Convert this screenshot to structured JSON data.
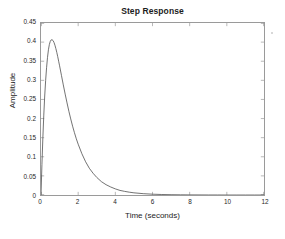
{
  "figure": {
    "background_color": "#ffffff",
    "axis_color": "#9a9a9a",
    "line_color": "#4d4d4d"
  },
  "chart_data": {
    "type": "line",
    "title": "Step Response",
    "xlabel": "Time (seconds)",
    "ylabel": "Amplitude",
    "xlim": [
      0,
      12
    ],
    "ylim": [
      0,
      0.45
    ],
    "grid": false,
    "legend": null,
    "xticks": [
      0,
      2,
      4,
      6,
      8,
      10,
      12
    ],
    "xtick_labels": [
      "0",
      "2",
      "4",
      "6",
      "8",
      "10",
      "12"
    ],
    "yticks": [
      0,
      0.05,
      0.1,
      0.15,
      0.2,
      0.25,
      0.3,
      0.35,
      0.4,
      0.45
    ],
    "ytick_labels": [
      "0",
      "0.05",
      "0.1",
      "0.15",
      "0.2",
      "0.25",
      "0.3",
      "0.35",
      "0.4",
      "0.45"
    ],
    "series": [
      {
        "name": "step response",
        "x": [
          0.0,
          0.05,
          0.1,
          0.15,
          0.2,
          0.25,
          0.3,
          0.35,
          0.4,
          0.45,
          0.5,
          0.55,
          0.6,
          0.65,
          0.7,
          0.75,
          0.8,
          0.85,
          0.9,
          0.95,
          1.0,
          1.1,
          1.2,
          1.3,
          1.4,
          1.5,
          1.6,
          1.7,
          1.8,
          1.9,
          2.0,
          2.2,
          2.4,
          2.6,
          2.8,
          3.0,
          3.25,
          3.5,
          3.75,
          4.0,
          4.25,
          4.5,
          4.75,
          5.0,
          5.5,
          6.0,
          6.5,
          7.0,
          7.5,
          8.0,
          8.5,
          9.0,
          9.5,
          10.0,
          10.5,
          11.0,
          11.5,
          12.0
        ],
        "y": [
          0.0,
          0.08,
          0.15,
          0.209,
          0.259,
          0.3,
          0.333,
          0.36,
          0.38,
          0.394,
          0.402,
          0.406,
          0.406,
          0.404,
          0.399,
          0.392,
          0.383,
          0.373,
          0.362,
          0.35,
          0.338,
          0.313,
          0.288,
          0.264,
          0.241,
          0.219,
          0.199,
          0.18,
          0.163,
          0.147,
          0.133,
          0.108,
          0.087,
          0.07,
          0.057,
          0.046,
          0.035,
          0.027,
          0.021,
          0.016,
          0.012,
          0.0095,
          0.0074,
          0.0057,
          0.0035,
          0.0021,
          0.0013,
          0.0008,
          0.0005,
          0.0003,
          0.0002,
          0.0001,
          0.0001,
          0.0,
          0.0,
          0.0,
          0.0,
          0.0
        ]
      }
    ],
    "annotations": {
      "peak_amplitude": 0.406,
      "peak_time": 0.57
    }
  },
  "caption": {
    "text": ""
  }
}
